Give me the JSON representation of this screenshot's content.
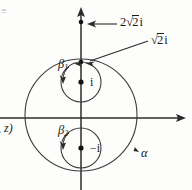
{
  "figure": {
    "type": "complex-plane-contour-diagram",
    "background_color": "#fdfdfc",
    "ink_color": "#1a1a1a",
    "labels": {
      "outer_point_value": "2",
      "outer_point_radical": "2",
      "outer_point_unit": "i",
      "inner_point_radical": "2",
      "inner_point_unit": "i",
      "pole_upper": "i",
      "pole_lower": "−i",
      "contour_outer": "α",
      "contour_inner_upper_base": "β",
      "contour_inner_upper_sub": "1",
      "contour_inner_lower_base": "β",
      "contour_inner_lower_sub": "2",
      "left_margin_text": ", z)",
      "corner_mark": "≡"
    },
    "geometry": {
      "origin_x": 81,
      "origin_y": 118,
      "axis_x_start": 0,
      "axis_x_end": 186,
      "axis_y_top": 8,
      "axis_y_bottom": 190,
      "outer_circle_center_x": 81,
      "outer_circle_center_y": 115,
      "outer_circle_radius": 56,
      "upper_circle_center_x": 81,
      "upper_circle_center_y": 82,
      "upper_circle_radius": 20,
      "lower_circle_center_x": 81,
      "lower_circle_center_y": 148,
      "lower_circle_radius": 20,
      "marked_point_2sqrt2_x": 81,
      "marked_point_2sqrt2_y": 22,
      "marked_point_sqrt2_x": 81,
      "marked_point_sqrt2_y": 62
    }
  }
}
